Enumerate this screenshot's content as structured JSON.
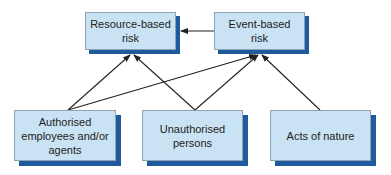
{
  "diagram": {
    "title": "",
    "colors": {
      "box_fill": "#c9e2f4",
      "box_border": "#8ea4b6",
      "shadow": "#1f5a9c",
      "arrow": "#222222"
    },
    "nodes": [
      {
        "id": "resource",
        "label": "Resource-based risk",
        "line1": "Resource-based",
        "line2": "risk"
      },
      {
        "id": "event",
        "label": "Event-based risk",
        "line1": "Event-based",
        "line2": "risk"
      },
      {
        "id": "authorised",
        "label": "Authorised employees and/or agents",
        "line1": "Authorised",
        "line2": "employees and/or",
        "line3": "agents"
      },
      {
        "id": "unauthorised",
        "label": "Unauthorised persons",
        "line1": "Unauthorised",
        "line2": "persons"
      },
      {
        "id": "nature",
        "label": "Acts of nature",
        "line1": "Acts of nature"
      }
    ],
    "edges": [
      {
        "from": "event",
        "to": "resource"
      },
      {
        "from": "authorised",
        "to": "resource"
      },
      {
        "from": "authorised",
        "to": "event"
      },
      {
        "from": "unauthorised",
        "to": "resource"
      },
      {
        "from": "unauthorised",
        "to": "event"
      },
      {
        "from": "nature",
        "to": "event"
      }
    ]
  }
}
